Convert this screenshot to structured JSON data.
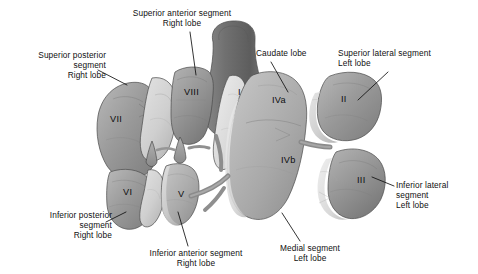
{
  "figure": {
    "background_color": "#ffffff",
    "text_color": "#101010"
  },
  "callouts": [
    {
      "id": "superior-anterior-segment-right-lobe",
      "lines": [
        "Superior anterior segment",
        "Right lobe"
      ],
      "text": "Superior anterior segment\nRight lobe",
      "align": "center",
      "x": 113,
      "y": 8,
      "w": 138,
      "leader": {
        "x1": 190,
        "y1": 32,
        "x2": 196,
        "y2": 75
      }
    },
    {
      "id": "superior-posterior-segment-right-lobe",
      "lines": [
        "Superior posterior",
        "segment",
        "Right lobe"
      ],
      "text": "Superior posterior\nsegment\nRight lobe",
      "align": "right",
      "x": 8,
      "y": 50,
      "w": 98,
      "leader": {
        "x1": 98,
        "y1": 70,
        "x2": 127,
        "y2": 85
      }
    },
    {
      "id": "caudate-lobe",
      "lines": [
        "Caudate lobe"
      ],
      "text": "Caudate lobe",
      "align": "left",
      "x": 256,
      "y": 48,
      "w": 70,
      "leader": {
        "x1": 271,
        "y1": 62,
        "x2": 288,
        "y2": 92
      }
    },
    {
      "id": "superior-lateral-segment-left-lobe",
      "lines": [
        "Superior lateral segment",
        "Left lobe"
      ],
      "text": "Superior lateral segment\nLeft lobe",
      "align": "left",
      "x": 338,
      "y": 48,
      "w": 134,
      "leader": {
        "x1": 388,
        "y1": 72,
        "x2": 358,
        "y2": 100
      }
    },
    {
      "id": "inferior-posterior-segment-right-lobe",
      "lines": [
        "Inferior posterior",
        "segment",
        "Right lobe"
      ],
      "text": "Inferior posterior\nsegment\nRight lobe",
      "align": "right",
      "x": 22,
      "y": 210,
      "w": 90,
      "leader": {
        "x1": 106,
        "y1": 222,
        "x2": 126,
        "y2": 212
      }
    },
    {
      "id": "inferior-anterior-segment-right-lobe",
      "lines": [
        "Inferior anterior segment",
        "Right lobe"
      ],
      "text": "Inferior anterior segment\nRight lobe",
      "align": "center",
      "x": 132,
      "y": 248,
      "w": 128,
      "leader": {
        "x1": 188,
        "y1": 246,
        "x2": 178,
        "y2": 212
      }
    },
    {
      "id": "medial-segment-left-lobe",
      "lines": [
        "Medial segment",
        "Left lobe"
      ],
      "text": "Medial segment\nLeft lobe",
      "align": "center",
      "x": 258,
      "y": 243,
      "w": 104,
      "leader": {
        "x1": 300,
        "y1": 241,
        "x2": 282,
        "y2": 213
      }
    },
    {
      "id": "inferior-lateral-segment-left-lobe",
      "lines": [
        "Inferior lateral",
        "segment",
        "Left lobe"
      ],
      "text": "Inferior lateral\nsegment\nLeft lobe",
      "align": "left",
      "x": 396,
      "y": 180,
      "w": 78,
      "leader": {
        "x1": 394,
        "y1": 186,
        "x2": 372,
        "y2": 177
      }
    }
  ],
  "segment_numbers": [
    {
      "id": "segment-vii",
      "label": "VII",
      "x": 110,
      "y": 115
    },
    {
      "id": "segment-viii",
      "label": "VIII",
      "x": 184,
      "y": 88
    },
    {
      "id": "segment-i",
      "label": "I",
      "x": 238,
      "y": 88
    },
    {
      "id": "segment-iva",
      "label": "IVa",
      "x": 272,
      "y": 96
    },
    {
      "id": "segment-ii",
      "label": "II",
      "x": 341,
      "y": 95
    },
    {
      "id": "segment-ivb",
      "label": "IVb",
      "x": 281,
      "y": 156
    },
    {
      "id": "segment-iii",
      "label": "III",
      "x": 357,
      "y": 176
    },
    {
      "id": "segment-vi",
      "label": "VI",
      "x": 123,
      "y": 188
    },
    {
      "id": "segment-v",
      "label": "V",
      "x": 178,
      "y": 190
    }
  ]
}
